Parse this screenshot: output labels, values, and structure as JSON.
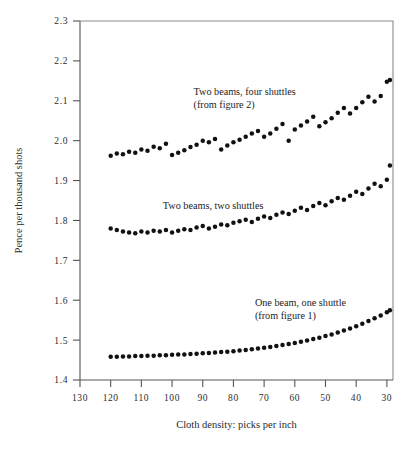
{
  "chart_data": {
    "type": "scatter",
    "title": "",
    "xlabel": "Cloth density: picks per inch",
    "ylabel": "Pence per thousand shots",
    "xlim": [
      130,
      28
    ],
    "ylim": [
      1.4,
      2.3
    ],
    "x_reversed": true,
    "grid": false,
    "legend_position": "inline-annotations",
    "xticks": [
      130,
      120,
      110,
      100,
      90,
      80,
      70,
      60,
      50,
      40,
      30
    ],
    "xtick_labels": [
      "130",
      "120",
      "110",
      "100",
      "90",
      "80",
      "70",
      "60",
      "50",
      "40",
      "30"
    ],
    "yticks": [
      1.4,
      1.5,
      1.6,
      1.7,
      1.8,
      1.9,
      2.0,
      2.1,
      2.2,
      2.3
    ],
    "ytick_labels": [
      "1.4",
      "1.5",
      "1.6",
      "1.7",
      "1.8",
      "1.9",
      "2.0",
      "2.1",
      "2.2",
      "2.3"
    ],
    "annotations": [
      {
        "name": "two-beams-four-shuttles-label",
        "lines": [
          "Two beams, four shuttles",
          "(from figure 2)"
        ],
        "x": 93,
        "y": 2.115
      },
      {
        "name": "two-beams-two-shuttles-label",
        "lines": [
          "Two beams, two shuttles"
        ],
        "x": 103,
        "y": 1.828
      },
      {
        "name": "one-beam-one-shuttle-label",
        "lines": [
          "One beam, one shuttle",
          "(from figure 1)"
        ],
        "x": 73,
        "y": 1.585
      }
    ],
    "series": [
      {
        "name": "Two beams, four shuttles",
        "marker": "circle",
        "color": "#111111",
        "x": [
          120,
          118,
          116,
          114,
          112,
          110,
          108,
          106,
          104,
          102,
          100,
          98,
          96,
          94,
          92,
          90,
          88,
          86,
          84,
          82,
          80,
          78,
          76,
          74,
          72,
          70,
          68,
          66,
          64,
          62,
          60,
          58,
          56,
          54,
          52,
          50,
          48,
          46,
          44,
          42,
          40,
          38,
          36,
          34,
          32,
          30,
          29
        ],
        "y": [
          1.962,
          1.968,
          1.966,
          1.972,
          1.97,
          1.978,
          1.975,
          1.985,
          1.981,
          1.992,
          1.964,
          1.97,
          1.976,
          1.984,
          1.99,
          2.0,
          1.996,
          2.004,
          1.978,
          1.988,
          1.996,
          2.002,
          2.01,
          2.018,
          2.024,
          2.01,
          2.018,
          2.03,
          2.042,
          2.0,
          2.028,
          2.038,
          2.048,
          2.06,
          2.036,
          2.046,
          2.056,
          2.07,
          2.082,
          2.068,
          2.082,
          2.096,
          2.11,
          2.098,
          2.112,
          2.148,
          2.152
        ]
      },
      {
        "name": "Two beams, two shuttles",
        "marker": "circle",
        "color": "#111111",
        "x": [
          120,
          118,
          116,
          114,
          112,
          110,
          108,
          106,
          104,
          102,
          100,
          98,
          96,
          94,
          92,
          90,
          88,
          86,
          84,
          82,
          80,
          78,
          76,
          74,
          72,
          70,
          68,
          66,
          64,
          62,
          60,
          58,
          56,
          54,
          52,
          50,
          48,
          46,
          44,
          42,
          40,
          38,
          36,
          34,
          32,
          30,
          29
        ],
        "y": [
          1.78,
          1.776,
          1.772,
          1.77,
          1.768,
          1.772,
          1.77,
          1.774,
          1.772,
          1.776,
          1.77,
          1.774,
          1.778,
          1.776,
          1.782,
          1.786,
          1.78,
          1.784,
          1.79,
          1.788,
          1.794,
          1.798,
          1.802,
          1.796,
          1.804,
          1.81,
          1.806,
          1.814,
          1.82,
          1.816,
          1.824,
          1.832,
          1.826,
          1.836,
          1.844,
          1.838,
          1.848,
          1.856,
          1.852,
          1.862,
          1.872,
          1.866,
          1.88,
          1.892,
          1.886,
          1.902,
          1.938
        ]
      },
      {
        "name": "One beam, one shuttle",
        "marker": "circle",
        "color": "#111111",
        "x": [
          120,
          118,
          116,
          114,
          112,
          110,
          108,
          106,
          104,
          102,
          100,
          98,
          96,
          94,
          92,
          90,
          88,
          86,
          84,
          82,
          80,
          78,
          76,
          74,
          72,
          70,
          68,
          66,
          64,
          62,
          60,
          58,
          56,
          54,
          52,
          50,
          48,
          46,
          44,
          42,
          40,
          38,
          36,
          34,
          32,
          30,
          29
        ],
        "y": [
          1.458,
          1.458,
          1.459,
          1.459,
          1.46,
          1.46,
          1.461,
          1.461,
          1.462,
          1.462,
          1.463,
          1.464,
          1.464,
          1.465,
          1.466,
          1.467,
          1.468,
          1.469,
          1.47,
          1.471,
          1.472,
          1.474,
          1.475,
          1.477,
          1.479,
          1.481,
          1.483,
          1.485,
          1.488,
          1.49,
          1.493,
          1.496,
          1.499,
          1.503,
          1.506,
          1.51,
          1.514,
          1.519,
          1.524,
          1.529,
          1.535,
          1.541,
          1.548,
          1.555,
          1.562,
          1.57,
          1.575
        ]
      }
    ]
  }
}
